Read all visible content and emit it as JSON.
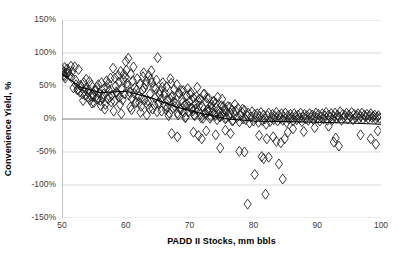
{
  "chart_data": {
    "type": "scatter",
    "title": "",
    "xlabel": "PADD II Stocks, mm bbls",
    "ylabel": "Convenience Yield, %",
    "xlim": [
      50,
      100
    ],
    "ylim": [
      -150,
      150
    ],
    "grid": true,
    "legend": false,
    "marker": "open-diamond",
    "marker_color": "#1a1a1a",
    "xticks": [
      50,
      60,
      70,
      80,
      90,
      100
    ],
    "xtick_labels": [
      "50",
      "60",
      "70",
      "80",
      "90",
      "100"
    ],
    "yticks": [
      150,
      100,
      50,
      0,
      -50,
      -100,
      -150
    ],
    "ytick_labels": [
      "150%",
      "100%",
      "50%",
      "0%",
      "-50%",
      "-100%",
      "-150%"
    ],
    "trendline": {
      "visible": true,
      "color": "#000000",
      "points": [
        [
          50,
          68
        ],
        [
          53,
          48
        ],
        [
          56,
          40
        ],
        [
          60,
          42
        ],
        [
          64,
          32
        ],
        [
          68,
          18
        ],
        [
          72,
          8
        ],
        [
          76,
          0
        ],
        [
          80,
          -3
        ],
        [
          85,
          -4
        ],
        [
          90,
          -5
        ],
        [
          95,
          -6
        ],
        [
          100,
          -8
        ]
      ]
    },
    "points": [
      [
        50.1,
        74
      ],
      [
        50.2,
        71
      ],
      [
        50.3,
        67
      ],
      [
        50.4,
        78
      ],
      [
        50.5,
        62
      ],
      [
        50.6,
        70
      ],
      [
        50.8,
        76
      ],
      [
        51.0,
        73
      ],
      [
        51.2,
        66
      ],
      [
        51.4,
        80
      ],
      [
        51.6,
        72
      ],
      [
        51.8,
        47
      ],
      [
        52.0,
        79
      ],
      [
        52.2,
        52
      ],
      [
        52.4,
        44
      ],
      [
        52.6,
        75
      ],
      [
        52.8,
        41
      ],
      [
        53.0,
        49
      ],
      [
        53.2,
        38
      ],
      [
        53.4,
        55
      ],
      [
        53.6,
        36
      ],
      [
        53.8,
        60
      ],
      [
        54.0,
        33
      ],
      [
        54.2,
        44
      ],
      [
        54.4,
        29
      ],
      [
        54.6,
        51
      ],
      [
        54.8,
        37
      ],
      [
        55.0,
        25
      ],
      [
        55.2,
        42
      ],
      [
        55.4,
        48
      ],
      [
        55.6,
        31
      ],
      [
        55.8,
        39
      ],
      [
        56.0,
        28
      ],
      [
        56.2,
        55
      ],
      [
        56.4,
        34
      ],
      [
        56.6,
        46
      ],
      [
        56.8,
        22
      ],
      [
        57.0,
        58
      ],
      [
        57.2,
        30
      ],
      [
        57.4,
        43
      ],
      [
        57.6,
        62
      ],
      [
        57.8,
        36
      ],
      [
        58.0,
        77
      ],
      [
        58.2,
        27
      ],
      [
        58.4,
        50
      ],
      [
        58.6,
        40
      ],
      [
        58.8,
        66
      ],
      [
        59.0,
        33
      ],
      [
        59.2,
        72
      ],
      [
        59.4,
        45
      ],
      [
        59.6,
        59
      ],
      [
        59.8,
        38
      ],
      [
        60.0,
        87
      ],
      [
        60.2,
        54
      ],
      [
        60.4,
        92
      ],
      [
        60.6,
        41
      ],
      [
        60.8,
        68
      ],
      [
        61.0,
        31
      ],
      [
        61.2,
        79
      ],
      [
        61.4,
        47
      ],
      [
        61.6,
        26
      ],
      [
        61.8,
        61
      ],
      [
        62.0,
        35
      ],
      [
        62.2,
        53
      ],
      [
        62.4,
        19
      ],
      [
        62.6,
        44
      ],
      [
        62.8,
        70
      ],
      [
        63.0,
        29
      ],
      [
        63.2,
        57
      ],
      [
        63.4,
        22
      ],
      [
        63.6,
        66
      ],
      [
        63.8,
        38
      ],
      [
        64.0,
        73
      ],
      [
        64.2,
        15
      ],
      [
        64.4,
        48
      ],
      [
        64.6,
        32
      ],
      [
        64.8,
        59
      ],
      [
        65.0,
        93
      ],
      [
        65.2,
        25
      ],
      [
        65.4,
        42
      ],
      [
        65.6,
        12
      ],
      [
        65.8,
        55
      ],
      [
        66.0,
        36
      ],
      [
        66.2,
        20
      ],
      [
        66.4,
        49
      ],
      [
        66.6,
        28
      ],
      [
        66.8,
        9
      ],
      [
        67.0,
        61
      ],
      [
        67.2,
        33
      ],
      [
        67.4,
        17
      ],
      [
        67.6,
        45
      ],
      [
        67.8,
        24
      ],
      [
        68.0,
        52
      ],
      [
        68.2,
        6
      ],
      [
        68.4,
        38
      ],
      [
        68.6,
        14
      ],
      [
        68.8,
        29
      ],
      [
        69.0,
        43
      ],
      [
        69.2,
        21
      ],
      [
        69.4,
        3
      ],
      [
        69.6,
        35
      ],
      [
        69.8,
        11
      ],
      [
        70.0,
        27
      ],
      [
        70.2,
        40
      ],
      [
        70.4,
        16
      ],
      [
        70.6,
        32
      ],
      [
        70.8,
        5
      ],
      [
        71.0,
        23
      ],
      [
        71.2,
        48
      ],
      [
        71.4,
        13
      ],
      [
        71.6,
        30
      ],
      [
        71.8,
        2
      ],
      [
        72.0,
        19
      ],
      [
        72.2,
        37
      ],
      [
        72.4,
        8
      ],
      [
        72.6,
        25
      ],
      [
        72.8,
        14
      ],
      [
        73.0,
        31
      ],
      [
        73.2,
        1
      ],
      [
        73.4,
        22
      ],
      [
        73.6,
        10
      ],
      [
        73.8,
        27
      ],
      [
        74.0,
        5
      ],
      [
        74.2,
        17
      ],
      [
        74.4,
        33
      ],
      [
        74.6,
        12
      ],
      [
        74.8,
        3
      ],
      [
        75.0,
        20
      ],
      [
        75.2,
        8
      ],
      [
        75.4,
        15
      ],
      [
        75.6,
        0
      ],
      [
        75.8,
        11
      ],
      [
        76.0,
        19
      ],
      [
        76.2,
        4
      ],
      [
        76.4,
        9
      ],
      [
        76.6,
        14
      ],
      [
        76.8,
        -2
      ],
      [
        77.0,
        7
      ],
      [
        77.2,
        12
      ],
      [
        77.4,
        2
      ],
      [
        77.6,
        16
      ],
      [
        77.8,
        -4
      ],
      [
        78.0,
        6
      ],
      [
        78.2,
        10
      ],
      [
        78.4,
        0
      ],
      [
        78.6,
        13
      ],
      [
        78.8,
        -1
      ],
      [
        79.0,
        5
      ],
      [
        79.2,
        9
      ],
      [
        79.4,
        -6
      ],
      [
        79.6,
        3
      ],
      [
        79.8,
        11
      ],
      [
        80.0,
        -3
      ],
      [
        80.2,
        7
      ],
      [
        80.4,
        1
      ],
      [
        80.6,
        8
      ],
      [
        80.8,
        -5
      ],
      [
        81.0,
        4
      ],
      [
        81.2,
        10
      ],
      [
        81.4,
        -2
      ],
      [
        81.6,
        6
      ],
      [
        81.8,
        0
      ],
      [
        82.0,
        -8
      ],
      [
        82.2,
        5
      ],
      [
        82.4,
        9
      ],
      [
        82.6,
        -4
      ],
      [
        82.8,
        2
      ],
      [
        83.0,
        7
      ],
      [
        83.2,
        -1
      ],
      [
        83.4,
        4
      ],
      [
        83.6,
        10
      ],
      [
        83.8,
        -3
      ],
      [
        84.0,
        6
      ],
      [
        84.2,
        1
      ],
      [
        84.4,
        8
      ],
      [
        84.6,
        -2
      ],
      [
        84.8,
        3
      ],
      [
        85.0,
        9
      ],
      [
        85.2,
        -5
      ],
      [
        85.4,
        5
      ],
      [
        85.6,
        0
      ],
      [
        85.8,
        7
      ],
      [
        86.0,
        2
      ],
      [
        86.2,
        -3
      ],
      [
        86.4,
        8
      ],
      [
        86.6,
        4
      ],
      [
        86.8,
        -1
      ],
      [
        87.0,
        6
      ],
      [
        87.2,
        1
      ],
      [
        87.4,
        9
      ],
      [
        87.6,
        -4
      ],
      [
        87.8,
        3
      ],
      [
        88.0,
        7
      ],
      [
        88.2,
        0
      ],
      [
        88.4,
        5
      ],
      [
        88.6,
        -2
      ],
      [
        88.8,
        8
      ],
      [
        89.0,
        2
      ],
      [
        89.2,
        6
      ],
      [
        89.4,
        -1
      ],
      [
        89.6,
        4
      ],
      [
        89.8,
        9
      ],
      [
        90.0,
        1
      ],
      [
        90.2,
        7
      ],
      [
        90.4,
        -3
      ],
      [
        90.6,
        3
      ],
      [
        90.8,
        8
      ],
      [
        91.0,
        0
      ],
      [
        91.2,
        5
      ],
      [
        91.4,
        10
      ],
      [
        91.6,
        -2
      ],
      [
        91.8,
        6
      ],
      [
        92.0,
        2
      ],
      [
        92.2,
        8
      ],
      [
        92.4,
        -1
      ],
      [
        92.6,
        4
      ],
      [
        92.8,
        9
      ],
      [
        93.0,
        1
      ],
      [
        93.2,
        6
      ],
      [
        93.4,
        3
      ],
      [
        93.6,
        11
      ],
      [
        93.8,
        -2
      ],
      [
        94.0,
        7
      ],
      [
        94.2,
        2
      ],
      [
        94.4,
        5
      ],
      [
        94.6,
        9
      ],
      [
        94.8,
        0
      ],
      [
        95.0,
        6
      ],
      [
        95.2,
        3
      ],
      [
        95.4,
        10
      ],
      [
        95.6,
        -1
      ],
      [
        95.8,
        7
      ],
      [
        96.0,
        2
      ],
      [
        96.2,
        5
      ],
      [
        96.4,
        8
      ],
      [
        96.6,
        1
      ],
      [
        96.8,
        4
      ],
      [
        97.0,
        9
      ],
      [
        97.2,
        0
      ],
      [
        97.4,
        6
      ],
      [
        97.6,
        3
      ],
      [
        97.8,
        7
      ],
      [
        98.0,
        1
      ],
      [
        98.2,
        5
      ],
      [
        98.4,
        8
      ],
      [
        98.6,
        2
      ],
      [
        98.8,
        4
      ],
      [
        99.0,
        6
      ],
      [
        99.2,
        0
      ],
      [
        99.4,
        3
      ],
      [
        99.6,
        5
      ],
      [
        99.8,
        1
      ],
      [
        52.5,
        45
      ],
      [
        53.5,
        42
      ],
      [
        54.5,
        35
      ],
      [
        55.5,
        30
      ],
      [
        56.5,
        38
      ],
      [
        57.5,
        33
      ],
      [
        58.5,
        41
      ],
      [
        59.5,
        29
      ],
      [
        60.5,
        36
      ],
      [
        61.5,
        24
      ],
      [
        62.5,
        32
      ],
      [
        63.5,
        27
      ],
      [
        64.5,
        21
      ],
      [
        65.5,
        30
      ],
      [
        66.5,
        18
      ],
      [
        67.5,
        26
      ],
      [
        68.5,
        15
      ],
      [
        69.5,
        23
      ],
      [
        70.5,
        12
      ],
      [
        71.5,
        20
      ],
      [
        72.5,
        9
      ],
      [
        73.5,
        17
      ],
      [
        74.5,
        7
      ],
      [
        75.5,
        14
      ],
      [
        54.3,
        57
      ],
      [
        55.7,
        52
      ],
      [
        57.1,
        48
      ],
      [
        58.9,
        56
      ],
      [
        60.3,
        50
      ],
      [
        61.7,
        44
      ],
      [
        63.1,
        52
      ],
      [
        64.7,
        46
      ],
      [
        66.1,
        40
      ],
      [
        67.3,
        35
      ],
      [
        68.7,
        43
      ],
      [
        70.1,
        37
      ],
      [
        71.3,
        28
      ],
      [
        72.7,
        32
      ],
      [
        74.1,
        24
      ],
      [
        75.3,
        19
      ],
      [
        53.3,
        28
      ],
      [
        54.7,
        24
      ],
      [
        56.1,
        20
      ],
      [
        57.7,
        26
      ],
      [
        59.1,
        22
      ],
      [
        60.7,
        18
      ],
      [
        62.1,
        25
      ],
      [
        63.7,
        16
      ],
      [
        65.1,
        23
      ],
      [
        66.3,
        14
      ],
      [
        67.7,
        19
      ],
      [
        69.1,
        10
      ],
      [
        70.3,
        16
      ],
      [
        71.7,
        7
      ],
      [
        73.1,
        13
      ],
      [
        74.7,
        4
      ],
      [
        58.3,
        62
      ],
      [
        59.7,
        68
      ],
      [
        61.1,
        58
      ],
      [
        62.7,
        64
      ],
      [
        64.1,
        55
      ],
      [
        65.7,
        48
      ],
      [
        67.1,
        54
      ],
      [
        68.3,
        40
      ],
      [
        69.7,
        46
      ],
      [
        71.1,
        34
      ],
      [
        72.3,
        38
      ],
      [
        73.7,
        26
      ],
      [
        75.1,
        30
      ],
      [
        76.3,
        18
      ],
      [
        77.1,
        22
      ],
      [
        78.3,
        15
      ],
      [
        56.7,
        15
      ],
      [
        58.1,
        12
      ],
      [
        59.3,
        8
      ],
      [
        60.9,
        14
      ],
      [
        62.3,
        10
      ],
      [
        63.3,
        6
      ],
      [
        64.9,
        11
      ],
      [
        66.7,
        5
      ],
      [
        68.1,
        9
      ],
      [
        69.3,
        2
      ],
      [
        70.7,
        6
      ],
      [
        72.1,
        1
      ],
      [
        73.3,
        4
      ],
      [
        74.3,
        -1
      ],
      [
        75.7,
        2
      ],
      [
        76.7,
        -3
      ],
      [
        67.2,
        -22
      ],
      [
        68.1,
        -27
      ],
      [
        70.6,
        -20
      ],
      [
        71.4,
        -25
      ],
      [
        71.9,
        -30
      ],
      [
        72.6,
        -18
      ],
      [
        74.1,
        -24
      ],
      [
        74.8,
        -44
      ],
      [
        75.6,
        -17
      ],
      [
        76.4,
        -22
      ],
      [
        77.8,
        -49
      ],
      [
        78.6,
        -50
      ],
      [
        79.1,
        -129
      ],
      [
        80.2,
        -84
      ],
      [
        80.9,
        -25
      ],
      [
        81.3,
        -57
      ],
      [
        81.6,
        -60
      ],
      [
        81.9,
        -114
      ],
      [
        82.1,
        -30
      ],
      [
        82.4,
        -58
      ],
      [
        83.1,
        -27
      ],
      [
        83.6,
        -34
      ],
      [
        84.0,
        -68
      ],
      [
        84.3,
        -36
      ],
      [
        84.6,
        -91
      ],
      [
        84.9,
        -30
      ],
      [
        85.4,
        -20
      ],
      [
        86.2,
        -15
      ],
      [
        87.9,
        -19
      ],
      [
        89.6,
        -13
      ],
      [
        91.8,
        -11
      ],
      [
        92.6,
        -35
      ],
      [
        92.9,
        -29
      ],
      [
        93.4,
        -41
      ],
      [
        96.8,
        -24
      ],
      [
        98.4,
        -30
      ],
      [
        99.2,
        -38
      ],
      [
        99.5,
        -18
      ],
      [
        50.4,
        65
      ],
      [
        50.9,
        69
      ],
      [
        51.5,
        63
      ],
      [
        52.1,
        59
      ],
      [
        52.9,
        51
      ],
      [
        53.7,
        46
      ],
      [
        54.1,
        40
      ],
      [
        54.9,
        34
      ],
      [
        55.3,
        44
      ],
      [
        56.3,
        31
      ],
      [
        57.3,
        54
      ],
      [
        58.7,
        37
      ],
      [
        59.9,
        63
      ],
      [
        60.1,
        74
      ],
      [
        61.3,
        39
      ],
      [
        62.9,
        47
      ],
      [
        63.9,
        60
      ],
      [
        65.3,
        37
      ],
      [
        66.9,
        31
      ],
      [
        68.9,
        25
      ],
      [
        69.9,
        19
      ],
      [
        70.9,
        15
      ],
      [
        72.9,
        11
      ],
      [
        73.9,
        8
      ]
    ]
  }
}
